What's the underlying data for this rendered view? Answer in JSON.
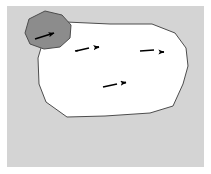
{
  "figure": {
    "title": "Schematic diagram of a region with directional flow arrows",
    "type": "line-drawing-diagram",
    "canvas": {
      "width": 211,
      "height": 174
    },
    "background_color": "#ffffff",
    "panel": {
      "name": "diagram-panel",
      "x": 7,
      "y": 6,
      "width": 197,
      "height": 161,
      "fill_color": "#d4d4d4"
    },
    "shapes": [
      {
        "name": "main-white-region",
        "role": "large outlined blob region",
        "fill_color": "#ffffff",
        "stroke_color": "#4d4d4d",
        "stroke_width": 1,
        "points": "66,22 110,24 152,24 175,33 186,48 188,66 183,84 173,106 150,113 105,116 67,117 46,102 39,84 38,58 44,38"
      },
      {
        "name": "gray-lobe-region",
        "role": "small shaded polygon attached to upper-left of main region",
        "fill_color": "#8c8c8c",
        "stroke_color": "#4d4d4d",
        "stroke_width": 1,
        "points": "45,11 62,15 71,25 70,38 60,47 44,49 30,44 25,33 29,19"
      }
    ],
    "arrows": [
      {
        "name": "arrow-lobe",
        "label": "flow arrow inside gray lobe",
        "color": "#000000",
        "direction": "right-up",
        "tail": {
          "x": 36,
          "y": 38
        },
        "head": {
          "x": 60,
          "y": 31
        }
      },
      {
        "name": "arrow-upper-left",
        "label": "flow arrow upper-left of white region",
        "color": "#000000",
        "direction": "right",
        "tail": {
          "x": 76,
          "y": 50
        },
        "head": {
          "x": 101,
          "y": 47
        }
      },
      {
        "name": "arrow-upper-right",
        "label": "flow arrow upper-right of white region",
        "color": "#000000",
        "direction": "right",
        "tail": {
          "x": 141,
          "y": 50
        },
        "head": {
          "x": 166,
          "y": 52
        }
      },
      {
        "name": "arrow-lower-center",
        "label": "flow arrow lower-centre of white region",
        "color": "#000000",
        "direction": "right-up",
        "tail": {
          "x": 104,
          "y": 86
        },
        "head": {
          "x": 128,
          "y": 82
        }
      }
    ],
    "colors": {
      "panel_background": "#d4d4d4",
      "region_fill": "#ffffff",
      "lobe_fill": "#8c8c8c",
      "outline": "#4d4d4d",
      "arrow": "#000000"
    },
    "labels": []
  }
}
